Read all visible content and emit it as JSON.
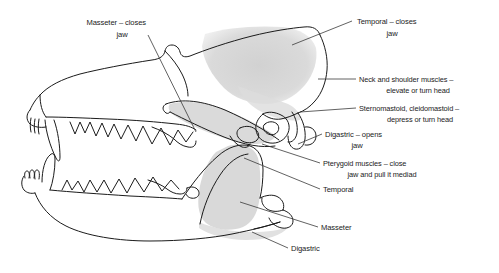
{
  "figure": {
    "background_color": "#ffffff",
    "line_color": "#1b1b1b",
    "shading_color": "#d6d6d6"
  },
  "labels": [
    {
      "id": "masseter-closes-jaw",
      "line1": "Masseter – closes",
      "line2": "jaw",
      "anchor": "zygomatic-arch"
    },
    {
      "id": "temporal-closes-jaw",
      "line1": "Temporal – closes",
      "line2": "jaw",
      "anchor": "temporal-fossa-cranium"
    },
    {
      "id": "neck-and-shoulder-muscles",
      "line1": "Neck and shoulder muscles –",
      "line2": "elevate or turn head",
      "anchor": "occipital-nuchal-crest"
    },
    {
      "id": "sternomastoid-cleidomastoid",
      "line1": "Sternomastoid,  cleidomastoid –",
      "line2": "depress or turn head",
      "anchor": "mastoid-process"
    },
    {
      "id": "digastric-opens-jaw",
      "line1": "Digastric – opens",
      "line2": "jaw",
      "anchor": "paroccipital-process"
    },
    {
      "id": "pterygoid-muscles",
      "line1": "Pterygoid muscles – close",
      "line2": "jaw and pull it mediad",
      "anchor": "mandible-medial-surface"
    },
    {
      "id": "temporal-mandible",
      "line1": "Temporal",
      "line2": "",
      "anchor": "coronoid-process"
    },
    {
      "id": "masseter-mandible",
      "line1": "Masseter",
      "line2": "",
      "anchor": "masseteric-fossa"
    },
    {
      "id": "digastric-mandible",
      "line1": "Digastric",
      "line2": "",
      "anchor": "mandible-ventral-border"
    }
  ]
}
